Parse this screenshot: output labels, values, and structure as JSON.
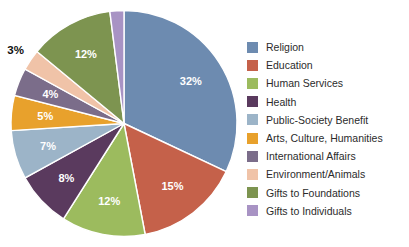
{
  "chart_data": {
    "type": "pie",
    "title": "",
    "xlabel": "",
    "ylabel": "",
    "legend_position": "right",
    "grid": false,
    "value_suffix": "%",
    "start_angle_deg": 0,
    "direction": "clockwise",
    "categories": [
      "Religion",
      "Education",
      "Human Services",
      "Health",
      "Public-Society Benefit",
      "Arts, Culture, Humanities",
      "International Affairs",
      "Environment/Animals",
      "Gifts to Foundations",
      "Gifts to Individuals"
    ],
    "values": [
      32,
      15,
      12,
      8,
      7,
      5,
      4,
      3,
      12,
      2
    ],
    "labels": [
      "32%",
      "15%",
      "12%",
      "8%",
      "7%",
      "5%",
      "4%",
      "3%",
      "12%",
      "2%"
    ],
    "colors": [
      "#6d8bb0",
      "#c5614a",
      "#9cbb5e",
      "#5a3a5e",
      "#9cb4c8",
      "#e8a12c",
      "#7b6d8a",
      "#f0c3a8",
      "#7d9450",
      "#a893c4"
    ],
    "label_placement": [
      "inside",
      "inside",
      "inside",
      "inside",
      "inside",
      "inside",
      "inside",
      "outside",
      "inside",
      "outside"
    ],
    "slices": [
      {
        "name": "Religion",
        "value": 32,
        "label": "32%",
        "color": "#6d8bb0",
        "placement": "inside"
      },
      {
        "name": "Education",
        "value": 15,
        "label": "15%",
        "color": "#c5614a",
        "placement": "inside"
      },
      {
        "name": "Human Services",
        "value": 12,
        "label": "12%",
        "color": "#9cbb5e",
        "placement": "inside"
      },
      {
        "name": "Health",
        "value": 8,
        "label": "8%",
        "color": "#5a3a5e",
        "placement": "inside"
      },
      {
        "name": "Public-Society Benefit",
        "value": 7,
        "label": "7%",
        "color": "#9cb4c8",
        "placement": "inside"
      },
      {
        "name": "Arts, Culture, Humanities",
        "value": 5,
        "label": "5%",
        "color": "#e8a12c",
        "placement": "inside"
      },
      {
        "name": "International Affairs",
        "value": 4,
        "label": "4%",
        "color": "#7b6d8a",
        "placement": "inside"
      },
      {
        "name": "Environment/Animals",
        "value": 3,
        "label": "3%",
        "color": "#f0c3a8",
        "placement": "outside"
      },
      {
        "name": "Gifts to Foundations",
        "value": 12,
        "label": "12%",
        "color": "#7d9450",
        "placement": "inside"
      },
      {
        "name": "Gifts to Individuals",
        "value": 2,
        "label": "2%",
        "color": "#a893c4",
        "placement": "outside"
      }
    ]
  },
  "legend": {
    "items": [
      {
        "label": "Religion",
        "color": "#6d8bb0"
      },
      {
        "label": "Education",
        "color": "#c5614a"
      },
      {
        "label": "Human Services",
        "color": "#9cbb5e"
      },
      {
        "label": "Health",
        "color": "#5a3a5e"
      },
      {
        "label": "Public-Society Benefit",
        "color": "#9cb4c8"
      },
      {
        "label": "Arts, Culture, Humanities",
        "color": "#e8a12c"
      },
      {
        "label": "International Affairs",
        "color": "#7b6d8a"
      },
      {
        "label": "Environment/Animals",
        "color": "#f0c3a8"
      },
      {
        "label": "Gifts to Foundations",
        "color": "#7d9450"
      },
      {
        "label": "Gifts to Individuals",
        "color": "#a893c4"
      }
    ]
  }
}
